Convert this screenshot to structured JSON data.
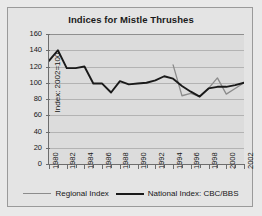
{
  "chart_data": {
    "type": "line",
    "title": "Indices for Mistle Thrushes",
    "xlabel": "",
    "ylabel": "Index: 2002=100",
    "ylim": [
      0,
      160
    ],
    "ytick_step": 20,
    "yticks": [
      0,
      20,
      40,
      60,
      80,
      100,
      120,
      140,
      160
    ],
    "xlim": [
      1980,
      2002
    ],
    "xticks": [
      1980,
      1982,
      1984,
      1986,
      1988,
      1990,
      1992,
      1994,
      1996,
      1998,
      2000,
      2002
    ],
    "xtick_labels": [
      "1980",
      "1982",
      "1984",
      "1986",
      "1988",
      "1990",
      "1992",
      "1994",
      "1996",
      "1998",
      "2000",
      "2002"
    ],
    "x_minor_ticks": [
      1980,
      1981,
      1982,
      1983,
      1984,
      1985,
      1986,
      1987,
      1988,
      1989,
      1990,
      1991,
      1992,
      1993,
      1994,
      1995,
      1996,
      1997,
      1998,
      1999,
      2000,
      2001,
      2002
    ],
    "grid": "horizontal",
    "legend_position": "bottom",
    "series": [
      {
        "name": "Regional Index",
        "color": "#8c8c8c",
        "x": [
          1994,
          1995,
          1996,
          1997,
          1998,
          1999,
          2000,
          2001,
          2002
        ],
        "values": [
          122,
          84,
          87,
          83,
          93,
          106,
          86,
          93,
          100
        ]
      },
      {
        "name": "National Index: CBC/BBS",
        "color": "#1a1a1a",
        "x": [
          1980,
          1981,
          1982,
          1983,
          1984,
          1985,
          1986,
          1987,
          1988,
          1989,
          1990,
          1991,
          1992,
          1993,
          1994,
          1995,
          1996,
          1997,
          1998,
          1999,
          2000,
          2001,
          2002
        ],
        "values": [
          127,
          140,
          118,
          118,
          120,
          99,
          99,
          88,
          102,
          98,
          99,
          100,
          103,
          108,
          105,
          96,
          89,
          83,
          93,
          95,
          95,
          97,
          100
        ]
      }
    ]
  },
  "legend": {
    "regional_label": "Regional Index",
    "national_label": "National Index: CBC/BBS"
  }
}
